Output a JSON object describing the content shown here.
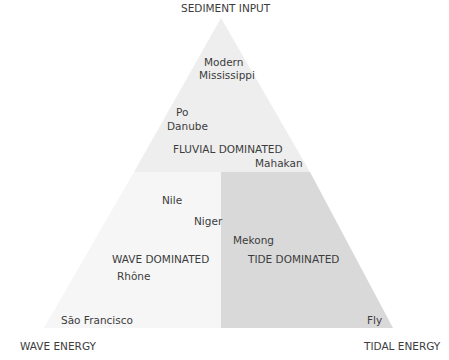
{
  "diagram": {
    "type": "ternary-delta-classification",
    "vertices": {
      "top": "SEDIMENT INPUT",
      "bottom_left": "WAVE ENERGY",
      "bottom_right": "TIDAL ENERGY"
    },
    "regions": {
      "fluvial": "FLUVIAL DOMINATED",
      "wave": "WAVE DOMINATED",
      "tide": "TIDE DOMINATED"
    },
    "deltas": {
      "modern": "Modern",
      "mississippi": "Mississippi",
      "po": "Po",
      "danube": "Danube",
      "mahakan": "Mahakan",
      "nile": "Nile",
      "niger": "Niger",
      "mekong": "Mekong",
      "rhone": "Rhône",
      "sao_francisco": "São Francisco",
      "fly": "Fly"
    },
    "colors": {
      "fluvial_fill": "#eeeeee",
      "wave_fill": "#f6f6f6",
      "tide_fill": "#d9d9d9"
    }
  }
}
